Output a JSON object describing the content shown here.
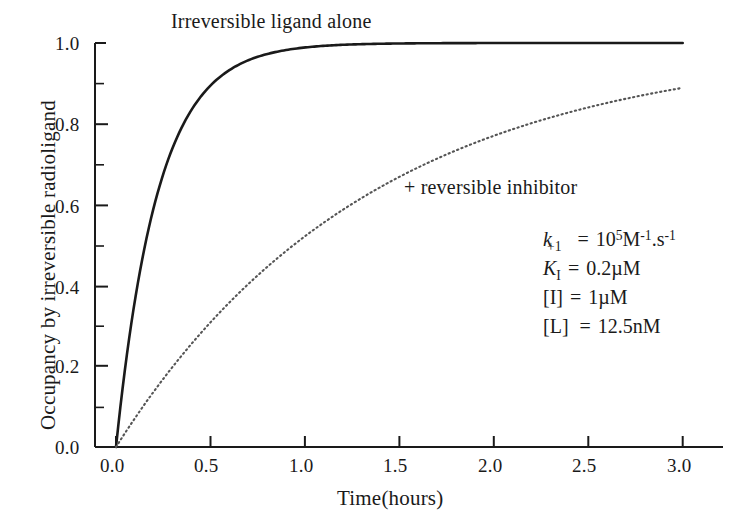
{
  "chart_data": {
    "type": "line",
    "title": "",
    "xlabel": "Time(hours)",
    "ylabel": "Occupancy by irreversible radioligand",
    "xlim": [
      0.0,
      3.0
    ],
    "ylim": [
      0.0,
      1.0
    ],
    "grid": false,
    "legend_position": "inline-annotation",
    "x_ticks": [
      "0.0",
      "0.5",
      "1.0",
      "1.5",
      "2.0",
      "2.5",
      "3.0"
    ],
    "x_tick_values": [
      0.0,
      0.5,
      1.0,
      1.5,
      2.0,
      2.5,
      3.0
    ],
    "y_ticks": [
      "0.0",
      "0.2",
      "0.4",
      "0.6",
      "0.8",
      "1.0"
    ],
    "y_tick_values": [
      0.0,
      0.2,
      0.4,
      0.6,
      0.8,
      1.0
    ],
    "y_minor_tick_values": [
      0.1,
      0.3,
      0.5,
      0.7,
      0.9
    ],
    "x": [
      0.0,
      0.1,
      0.2,
      0.3,
      0.4,
      0.5,
      0.6,
      0.7,
      0.8,
      0.9,
      1.0,
      1.2,
      1.4,
      1.6,
      1.8,
      2.0,
      2.2,
      2.4,
      2.6,
      2.8,
      3.0
    ],
    "series": [
      {
        "name": "Irreversible ligand alone",
        "style": "solid",
        "color": "#1a1a1a",
        "rate_per_hour": 4.5,
        "values": [
          0.0,
          0.362,
          0.593,
          0.741,
          0.835,
          0.895,
          0.933,
          0.957,
          0.973,
          0.983,
          0.989,
          0.995,
          0.998,
          0.999,
          1.0,
          1.0,
          1.0,
          1.0,
          1.0,
          1.0,
          1.0
        ]
      },
      {
        "name": "+ reversible inhibitor",
        "style": "dotted",
        "color": "#555555",
        "rate_per_hour": 0.74,
        "values": [
          0.0,
          0.071,
          0.137,
          0.199,
          0.256,
          0.309,
          0.359,
          0.405,
          0.447,
          0.487,
          0.523,
          0.588,
          0.643,
          0.69,
          0.731,
          0.772,
          0.798,
          0.824,
          0.846,
          0.866,
          0.889
        ]
      }
    ],
    "annotations": [
      {
        "name": "solid-curve-label",
        "text": "Irreversible ligand alone",
        "x": 0.62,
        "y": 1.03
      },
      {
        "name": "dotted-curve-label",
        "text": "+ reversible inhibitor",
        "x": 1.56,
        "y": 0.645
      }
    ]
  },
  "parameters": {
    "k_plus_1": {
      "symbol": "k",
      "subscript": "+1",
      "equals": "=",
      "value": "10",
      "value_exponent": "5",
      "unit_m": "M",
      "unit_m_exp": "-1",
      "unit_sep": ".s",
      "unit_s_exp": "-1"
    },
    "K_I": {
      "symbol": "K",
      "subscript": "I",
      "equals": "=",
      "value": "0.2µM"
    },
    "conc_I": {
      "symbol": "[I]",
      "equals": "=",
      "value": "1µM"
    },
    "conc_L": {
      "symbol": "[L]",
      "equals": "=",
      "value": "12.5nM"
    }
  }
}
